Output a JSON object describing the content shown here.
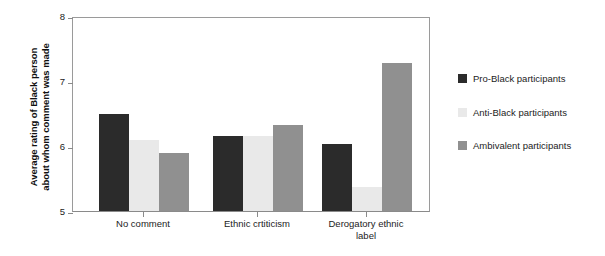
{
  "chart_data": {
    "type": "bar",
    "title": "",
    "subtitle": "",
    "xlabel": "",
    "ylabel": "Average rating of Black person\nabout whom comment was made",
    "ylim": [
      5,
      8
    ],
    "yticks": [
      5,
      6,
      7,
      8
    ],
    "ytick_labels": [
      "5",
      "6",
      "7",
      "8"
    ],
    "grid": false,
    "legend_position": "right",
    "categories": [
      "No comment",
      "Ethnic crtiticism",
      "Derogatory ethnic\nlabel"
    ],
    "series": [
      {
        "name": "Pro-Black participants",
        "color": "#2b2b2b",
        "values": [
          6.5,
          6.15,
          6.03
        ]
      },
      {
        "name": "Anti-Black participants",
        "color": "#e9e9e9",
        "values": [
          6.1,
          6.15,
          5.37
        ]
      },
      {
        "name": "Ambivalent participants",
        "color": "#909090",
        "values": [
          5.9,
          6.32,
          7.28
        ]
      }
    ]
  },
  "axis": {
    "y_title_line1": "Average rating of Black person",
    "y_title_line2": "about whom comment was made"
  },
  "legend": {
    "entries": [
      {
        "label": "Pro-Black participants",
        "color": "#2b2b2b"
      },
      {
        "label": "Anti-Black participants",
        "color": "#e9e9e9"
      },
      {
        "label": "Ambivalent participants",
        "color": "#909090"
      }
    ]
  },
  "colors": {
    "pro_black": "#2b2b2b",
    "anti_black": "#e9e9e9",
    "ambivalent": "#909090",
    "axis": "#8a8a8a",
    "background": "#ffffff"
  }
}
